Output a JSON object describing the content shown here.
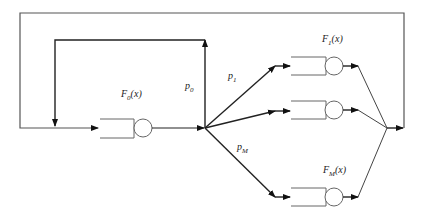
{
  "diagram": {
    "type": "queueing-network",
    "colors": {
      "line": "#333333",
      "background": "#ffffff"
    },
    "nodes": {
      "input_queue": {
        "label": "F",
        "sub": "0",
        "arg": "(x)"
      },
      "branch_queues": [
        {
          "label": "F",
          "sub": "1",
          "arg": "(x)"
        },
        {
          "label": "",
          "sub": "",
          "arg": ""
        },
        {
          "label": "F",
          "sub": "M",
          "arg": "(x)"
        }
      ]
    },
    "probabilities": {
      "p0": {
        "label": "p",
        "sub": "0"
      },
      "p1": {
        "label": "p",
        "sub": "1"
      },
      "pM": {
        "label": "p",
        "sub": "M"
      }
    }
  }
}
